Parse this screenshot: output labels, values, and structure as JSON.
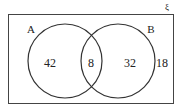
{
  "diagram": {
    "type": "venn",
    "universal_symbol": "ξ",
    "sets": [
      {
        "label": "A",
        "only": "42"
      },
      {
        "label": "B",
        "only": "32"
      }
    ],
    "intersection": "8",
    "outside": "18"
  },
  "colors": {
    "stroke": "#333333",
    "text": "#222222",
    "background": "#ffffff"
  }
}
